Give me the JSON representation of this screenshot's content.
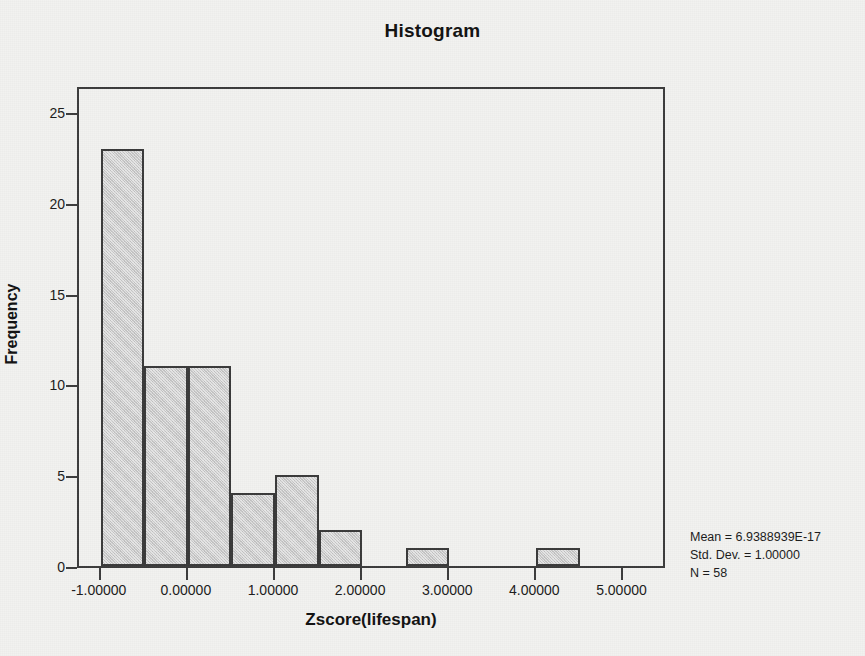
{
  "chart_data": {
    "type": "bar",
    "title": "Histogram",
    "xlabel": "Zscore(lifespan)",
    "ylabel": "Frequency",
    "xlim": [
      -1.25,
      5.5
    ],
    "ylim": [
      0,
      26.5
    ],
    "grid": false,
    "legend": null,
    "bin_width": 0.5,
    "bins": [
      {
        "left": -1.0,
        "right": -0.5,
        "value": 23
      },
      {
        "left": -0.5,
        "right": 0.0,
        "value": 11
      },
      {
        "left": 0.0,
        "right": 0.5,
        "value": 11
      },
      {
        "left": 0.5,
        "right": 1.0,
        "value": 4
      },
      {
        "left": 1.0,
        "right": 1.5,
        "value": 5
      },
      {
        "left": 1.5,
        "right": 2.0,
        "value": 2
      },
      {
        "left": 2.5,
        "right": 3.0,
        "value": 1
      },
      {
        "left": 4.0,
        "right": 4.5,
        "value": 1
      }
    ],
    "values": [
      23,
      11,
      11,
      4,
      5,
      2,
      1,
      1
    ],
    "xticks": [
      {
        "value": -1,
        "label": "-1.00000"
      },
      {
        "value": 0,
        "label": "0.00000"
      },
      {
        "value": 1,
        "label": "1.00000"
      },
      {
        "value": 2,
        "label": "2.00000"
      },
      {
        "value": 3,
        "label": "3.00000"
      },
      {
        "value": 4,
        "label": "4.00000"
      },
      {
        "value": 5,
        "label": "5.00000"
      }
    ],
    "yticks": [
      {
        "value": 0,
        "label": "0"
      },
      {
        "value": 5,
        "label": "5"
      },
      {
        "value": 10,
        "label": "10"
      },
      {
        "value": 15,
        "label": "15"
      },
      {
        "value": 20,
        "label": "20"
      },
      {
        "value": 25,
        "label": "25"
      }
    ],
    "annotations": {
      "mean": "Mean = 6.9388939E-17",
      "std_dev": "Std. Dev. = 1.00000",
      "n": "N = 58"
    },
    "colors": {
      "bar_fill": "#cbcbcb",
      "bar_border": "#3a3a3a",
      "frame": "#3c3c3c",
      "background": "#f2f2f0",
      "text": "#111111"
    }
  }
}
